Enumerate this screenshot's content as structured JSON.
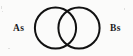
{
  "figure": {
    "name": "venn-diagram-two-sets",
    "background_color": "#fbfbfa",
    "stroke_color": "#111111",
    "stroke_width": 2,
    "width": 133,
    "height": 56
  },
  "labels": {
    "left": "As",
    "right": "Bs"
  },
  "circles": {
    "left": {
      "cx": 55.5,
      "cy": 28,
      "r": 22
    },
    "right": {
      "cx": 79,
      "cy": 28,
      "r": 22
    }
  },
  "chart_data": {
    "type": "diagram",
    "subtype": "venn",
    "title": "",
    "sets": [
      {
        "id": "A",
        "label": "As",
        "cx": 55.5,
        "cy": 28,
        "r": 22
      },
      {
        "id": "B",
        "label": "Bs",
        "cx": 79,
        "cy": 28,
        "r": 22
      }
    ],
    "regions": [
      {
        "id": "A-only",
        "label": ""
      },
      {
        "id": "A-and-B",
        "label": ""
      },
      {
        "id": "B-only",
        "label": ""
      }
    ],
    "legend": "none",
    "grid": false
  }
}
